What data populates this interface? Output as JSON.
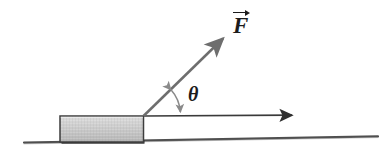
{
  "figure": {
    "kind": "physics-free-body-diagram",
    "background_color": "#ffffff",
    "width": 390,
    "height": 160
  },
  "labels": {
    "force": "F",
    "force_accent": "vector-arrow",
    "angle": "θ"
  },
  "colors": {
    "ink": "#1c1c1c",
    "vector_stroke": "#6e6e6e",
    "arc_stroke": "#8a8a8a",
    "ground_stroke": "#4a4a4a",
    "block_fill_light": "#d8d8d8",
    "block_fill_dark": "#b6b6b6",
    "block_border": "#3d3d3d",
    "block_shadow": "#2b2b2b"
  },
  "geometry": {
    "origin": {
      "x": 143,
      "y": 116
    },
    "force_tip": {
      "x": 229,
      "y": 32
    },
    "force_angle_degrees": 44,
    "horizontal_arrow": {
      "x1": 143,
      "y1": 116,
      "x2": 299,
      "y2": 115
    },
    "ground_line": {
      "x1": 24,
      "y1": 142,
      "x2": 378,
      "y2": 136
    },
    "block": {
      "x": 60,
      "y": 116,
      "width": 83,
      "height": 26
    },
    "angle_arc_radius": 38
  },
  "elements": {
    "force_vector_name": "force-vector-F",
    "horizontal_vector_name": "horizontal-displacement-arrow",
    "block_name": "block",
    "ground_name": "ground-line",
    "arc_name": "angle-arc"
  }
}
